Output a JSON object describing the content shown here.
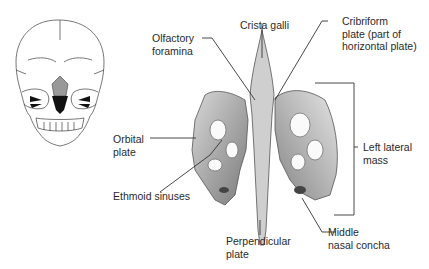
{
  "figure": {
    "inset": {
      "name": "skull-anterior-view"
    },
    "labels": {
      "olfactory_foramina": [
        "Olfactory",
        "foramina"
      ],
      "crista_galli": [
        "Crista galli"
      ],
      "cribriform_plate": [
        "Cribriform",
        "plate (part of",
        "horizontal plate)"
      ],
      "orbital_plate": [
        "Orbital",
        "plate"
      ],
      "left_lateral_mass": [
        "Left lateral",
        "mass"
      ],
      "ethmoid_sinuses": [
        "Ethmoid sinuses"
      ],
      "perpendicular_plate": [
        "Perpendicular",
        "plate"
      ],
      "middle_nasal_concha": [
        "Middle",
        "nasal concha"
      ]
    },
    "colors": {
      "bone_light": "#e9e9e9",
      "bone_mid": "#b9b9b9",
      "bone_dark": "#6a6a6a",
      "leader_line": "#333333",
      "text": "#2a2a2a"
    }
  }
}
